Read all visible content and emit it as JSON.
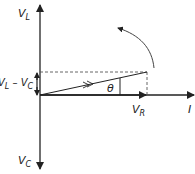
{
  "diagram": {
    "labels": {
      "vl": {
        "main": "V",
        "sub": "L"
      },
      "vc": {
        "main": "V",
        "sub": "C"
      },
      "vr": {
        "main": "V",
        "sub": "R"
      },
      "diff": {
        "a": "V",
        "a_sub": "L",
        "op": " – ",
        "b": "V",
        "b_sub": "C"
      },
      "theta": "θ",
      "current": "I"
    },
    "colors": {
      "line": "#222222",
      "dashed": "#555555"
    }
  }
}
